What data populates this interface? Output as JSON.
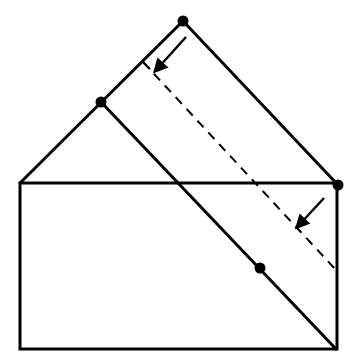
{
  "diagram": {
    "colors": {
      "stroke": "#000000",
      "background": "#ffffff"
    },
    "rectangle": {
      "x1": 20,
      "y1": 183,
      "x2": 337,
      "y2": 349
    },
    "solid_lines": [
      {
        "name": "roof-left",
        "x1": 20,
        "y1": 183,
        "x2": 183,
        "y2": 21
      },
      {
        "name": "flap-right-edge",
        "x1": 183,
        "y1": 21,
        "x2": 338,
        "y2": 185
      },
      {
        "name": "diagonal-crease",
        "x1": 101,
        "y1": 102,
        "x2": 336,
        "y2": 349
      }
    ],
    "dashed_line": {
      "name": "fold-line",
      "x1": 143,
      "y1": 62,
      "x2": 336,
      "y2": 270,
      "tick_x2": 150,
      "tick_y2": 69
    },
    "points": [
      {
        "name": "apex-dot",
        "x": 183,
        "y": 21
      },
      {
        "name": "left-dot",
        "x": 101,
        "y": 102
      },
      {
        "name": "right-corner-dot",
        "x": 338,
        "y": 185
      },
      {
        "name": "crease-dot",
        "x": 260,
        "y": 268
      }
    ],
    "arrows": [
      {
        "name": "fold-arrow-top",
        "x1": 186,
        "y1": 37,
        "x2": 158,
        "y2": 68
      },
      {
        "name": "fold-arrow-bottom",
        "x1": 324,
        "y1": 198,
        "x2": 300,
        "y2": 224
      }
    ]
  }
}
